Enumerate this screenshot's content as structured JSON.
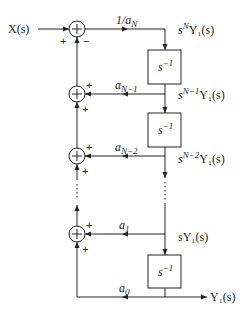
{
  "diagram": {
    "type": "block-diagram",
    "input": {
      "label": "X(s)"
    },
    "output": {
      "label": "Y₁(s)"
    },
    "summers": [
      {
        "id": "sum-top",
        "signs": {
          "left": "+",
          "bottom": "−"
        }
      },
      {
        "id": "sum-n-1",
        "signs": {
          "right": "+",
          "bottom": "+"
        }
      },
      {
        "id": "sum-n-2",
        "signs": {
          "right": "+",
          "bottom": "+"
        }
      },
      {
        "id": "sum-1",
        "signs": {
          "right": "+",
          "bottom": "+"
        }
      }
    ],
    "integrators": [
      {
        "label_base": "s",
        "label_exp": "−1"
      },
      {
        "label_base": "s",
        "label_exp": "−1"
      },
      {
        "label_base": "s",
        "label_exp": "−1"
      }
    ],
    "gains": {
      "forward": {
        "base": "1/a",
        "sub": "N"
      },
      "a_n_minus_1": {
        "base": "a",
        "sub": "N−1"
      },
      "a_n_minus_2": {
        "base": "a",
        "sub": "N−2"
      },
      "a_1": {
        "base": "a",
        "sub": "1"
      },
      "a_0": {
        "base": "a",
        "sub": "0"
      }
    },
    "signals": {
      "sN": {
        "pre": "s",
        "exp": "N",
        "post": "Y₁(s)"
      },
      "sN1": {
        "pre": "s",
        "exp": "N−1",
        "post": "Y₁(s)"
      },
      "sN2": {
        "pre": "s",
        "exp": "N−2",
        "post": "Y₁(s)"
      },
      "s1": {
        "pre": "sY₁(s)"
      }
    },
    "ellipsis": "⋮"
  }
}
